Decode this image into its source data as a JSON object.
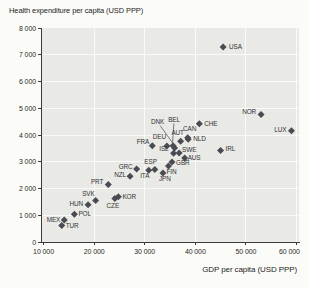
{
  "chart_data": {
    "type": "scatter",
    "title": "Health expenditure per capita (USD PPP)",
    "xlabel": "GDP per capita (USD PPP)",
    "ylabel": "Health expenditure per capita (USD PPP)",
    "xlim": [
      9500,
      60500
    ],
    "ylim": [
      0,
      8000
    ],
    "grid": true,
    "legend": "none",
    "x_ticks": [
      {
        "v": 10000,
        "label": "10 000"
      },
      {
        "v": 20000,
        "label": "20 000"
      },
      {
        "v": 30000,
        "label": "30 000"
      },
      {
        "v": 40000,
        "label": "40 000"
      },
      {
        "v": 50000,
        "label": "50 000"
      },
      {
        "v": 60000,
        "label": "60 000",
        "dx": -7
      }
    ],
    "y_ticks": [
      {
        "v": 0,
        "label": "0"
      },
      {
        "v": 1000,
        "label": "1 000"
      },
      {
        "v": 2000,
        "label": "2 000"
      },
      {
        "v": 3000,
        "label": "3 000"
      },
      {
        "v": 4000,
        "label": "4 000"
      },
      {
        "v": 5000,
        "label": "5 000"
      },
      {
        "v": 6000,
        "label": "6 000"
      },
      {
        "v": 7000,
        "label": "7 000"
      },
      {
        "v": 8000,
        "label": "8 000"
      }
    ],
    "points": [
      {
        "code": "USA",
        "gdp": 45500,
        "he": 7290,
        "lbl": {
          "a": "start",
          "dx": 6,
          "dy": 2
        }
      },
      {
        "code": "NOR",
        "gdp": 53000,
        "he": 4763,
        "lbl": {
          "a": "end",
          "dx": -5,
          "dy": -1
        }
      },
      {
        "code": "LUX",
        "gdp": 59000,
        "he": 4162,
        "lbl": {
          "a": "end",
          "dx": -5,
          "dy": 1
        }
      },
      {
        "code": "CHE",
        "gdp": 40800,
        "he": 4417,
        "lbl": {
          "a": "start",
          "dx": 5,
          "dy": 2
        }
      },
      {
        "code": "IRL",
        "gdp": 45000,
        "he": 3424,
        "lbl": {
          "a": "start",
          "dx": 5,
          "dy": 1
        }
      },
      {
        "code": "CAN",
        "gdp": 38500,
        "he": 3895,
        "lbl": {
          "a": "middle",
          "dx": 2,
          "dy": -7
        }
      },
      {
        "code": "NLD",
        "gdp": 38600,
        "he": 3837,
        "lbl": {
          "a": "start",
          "dx": 5,
          "dy": 2
        }
      },
      {
        "code": "AUT",
        "gdp": 37100,
        "he": 3763,
        "lbl": {
          "a": "middle",
          "dx": -3,
          "dy": -6
        }
      },
      {
        "code": "BEL",
        "gdp": 35600,
        "he": 3595,
        "lbl": {
          "a": "middle",
          "dx": 1,
          "dy": -24,
          "callout": true
        }
      },
      {
        "code": "DNK",
        "gdp": 35900,
        "he": 3512,
        "lbl": {
          "a": "middle",
          "dx": -17,
          "dy": -24,
          "callout": true
        }
      },
      {
        "code": "DEU",
        "gdp": 34400,
        "he": 3588,
        "lbl": {
          "a": "end",
          "dx": -1,
          "dy": -7
        }
      },
      {
        "code": "FRA",
        "gdp": 31500,
        "he": 3601,
        "lbl": {
          "a": "end",
          "dx": -3,
          "dy": -2
        }
      },
      {
        "code": "SWE",
        "gdp": 36800,
        "he": 3323,
        "lbl": {
          "a": "start",
          "dx": 3,
          "dy": -1
        }
      },
      {
        "code": "ISL",
        "gdp": 35700,
        "he": 3320,
        "lbl": {
          "a": "end",
          "dx": -5,
          "dy": -2
        }
      },
      {
        "code": "AUS",
        "gdp": 37900,
        "he": 3137,
        "lbl": {
          "a": "start",
          "dx": 3,
          "dy": 2
        }
      },
      {
        "code": "GBR",
        "gdp": 35400,
        "he": 2992,
        "lbl": {
          "a": "start",
          "dx": 4,
          "dy": 3
        }
      },
      {
        "code": "FIN",
        "gdp": 34700,
        "he": 2840,
        "lbl": {
          "a": "middle",
          "dx": 3,
          "dy": 8
        }
      },
      {
        "code": "ESP",
        "gdp": 32000,
        "he": 2713,
        "lbl": {
          "a": "end",
          "dx": 2,
          "dy": -5
        }
      },
      {
        "code": "ITA",
        "gdp": 30800,
        "he": 2686,
        "lbl": {
          "a": "middle",
          "dx": -4,
          "dy": 8
        }
      },
      {
        "code": "GRC",
        "gdp": 28400,
        "he": 2727,
        "lbl": {
          "a": "end",
          "dx": -4,
          "dy": 0
        }
      },
      {
        "code": "JPN",
        "gdp": 33600,
        "he": 2581,
        "lbl": {
          "a": "middle",
          "dx": 2,
          "dy": 8
        }
      },
      {
        "code": "NZL",
        "gdp": 27100,
        "he": 2454,
        "lbl": {
          "a": "end",
          "dx": -4,
          "dy": 1
        }
      },
      {
        "code": "PRT",
        "gdp": 22800,
        "he": 2150,
        "lbl": {
          "a": "end",
          "dx": -5,
          "dy": 0
        }
      },
      {
        "code": "KOR",
        "gdp": 24800,
        "he": 1688,
        "lbl": {
          "a": "start",
          "dx": 4,
          "dy": 2
        }
      },
      {
        "code": "CZE",
        "gdp": 24100,
        "he": 1626,
        "lbl": {
          "a": "middle",
          "dx": -2,
          "dy": 9
        }
      },
      {
        "code": "SVK",
        "gdp": 20300,
        "he": 1555,
        "lbl": {
          "a": "end",
          "dx": -1,
          "dy": -4
        }
      },
      {
        "code": "HUN",
        "gdp": 18800,
        "he": 1388,
        "lbl": {
          "a": "end",
          "dx": -5,
          "dy": 1
        }
      },
      {
        "code": "POL",
        "gdp": 16100,
        "he": 1035,
        "lbl": {
          "a": "start",
          "dx": 4,
          "dy": 2
        }
      },
      {
        "code": "MEX",
        "gdp": 14100,
        "he": 823,
        "lbl": {
          "a": "end",
          "dx": -4,
          "dy": 2
        }
      },
      {
        "code": "TUR",
        "gdp": 13600,
        "he": 618,
        "lbl": {
          "a": "start",
          "dx": 4,
          "dy": 3
        }
      }
    ]
  },
  "style": {
    "page_bg": "#fbfbf8",
    "plot_bg": "#e9e9e5",
    "grid_color": "#fafaf8",
    "axis_color": "#3c3c3c",
    "marker_color": "#4a4a52",
    "callout_color": "#4a4a52"
  },
  "plot": {
    "x": 41,
    "y": 28,
    "w": 258,
    "h": 214
  }
}
